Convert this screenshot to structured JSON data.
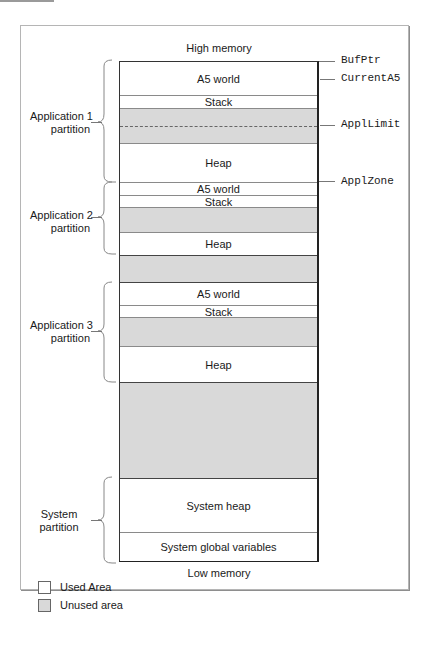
{
  "diagram": {
    "top_label": "High memory",
    "bottom_label": "Low memory",
    "segments": [
      {
        "label": "A5 world",
        "type": "used",
        "top": 0,
        "height": 33
      },
      {
        "label": "Stack",
        "type": "used",
        "top": 33,
        "height": 13
      },
      {
        "label": "",
        "type": "unused",
        "top": 46,
        "height": 35,
        "dashed": true
      },
      {
        "label": "Heap",
        "type": "used",
        "top": 81,
        "height": 39
      },
      {
        "label": "A5 world",
        "type": "used",
        "top": 120,
        "height": 13
      },
      {
        "label": "Stack",
        "type": "used",
        "top": 133,
        "height": 12
      },
      {
        "label": "",
        "type": "unused",
        "top": 145,
        "height": 25
      },
      {
        "label": "Heap",
        "type": "used",
        "top": 170,
        "height": 23
      },
      {
        "label": "",
        "type": "unused",
        "top": 193,
        "height": 27
      },
      {
        "label": "A5 world",
        "type": "used",
        "top": 220,
        "height": 23
      },
      {
        "label": "Stack",
        "type": "used",
        "top": 243,
        "height": 12
      },
      {
        "label": "",
        "type": "unused",
        "top": 255,
        "height": 29
      },
      {
        "label": "Heap",
        "type": "used",
        "top": 284,
        "height": 36
      },
      {
        "label": "",
        "type": "unused",
        "top": 320,
        "height": 96
      },
      {
        "label": "System heap",
        "type": "used",
        "top": 416,
        "height": 54
      },
      {
        "label": "System global variables",
        "type": "used",
        "top": 470,
        "height": 29
      }
    ],
    "partitions": [
      {
        "line1": "Application 1",
        "line2": "partition"
      },
      {
        "line1": "Application 2",
        "line2": "partition"
      },
      {
        "line1": "Application 3",
        "line2": "partition"
      },
      {
        "line1": "System",
        "line2": "partition"
      }
    ],
    "pointers": [
      {
        "name": "BufPtr"
      },
      {
        "name": "CurrentA5"
      },
      {
        "name": "ApplLimit"
      },
      {
        "name": "ApplZone"
      }
    ]
  },
  "legend": {
    "items": [
      {
        "label": "Used Area",
        "color": "#ffffff"
      },
      {
        "label": "Unused area",
        "color": "#d9d9d9"
      }
    ]
  }
}
